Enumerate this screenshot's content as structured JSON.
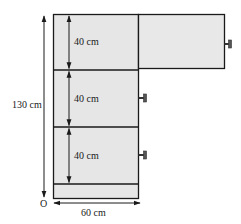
{
  "figure": {
    "type": "cabinet-dimension-diagram",
    "colors": {
      "panel_fill": "#e6e6e6",
      "stroke": "#1a1a1a",
      "background": "#ffffff"
    },
    "labels": {
      "total_height": "130 cm",
      "width": "60 cm",
      "origin": "O",
      "shelf_heights": [
        "40 cm",
        "40 cm",
        "40 cm"
      ]
    },
    "cabinet": {
      "compartments": 3,
      "base_present": true,
      "top_door_state": "open",
      "door_handles": 3
    }
  }
}
